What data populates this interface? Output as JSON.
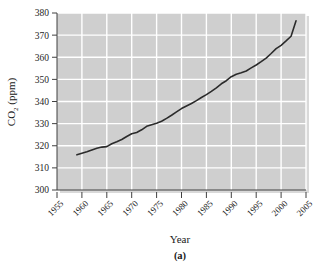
{
  "figure": {
    "panel_label": "(a)",
    "background_color": "#ffffff",
    "plot_background_color": "#cfcfcf",
    "grid_color": "#ffffff",
    "line_color": "#2b2b2b",
    "axis_color": "#404040",
    "shadow_color": "#d9d9d9"
  },
  "chart_data": {
    "type": "line",
    "title": "",
    "xlabel": "Year",
    "ylabel": "CO₂ (ppm)",
    "ylabel_main": "CO",
    "ylabel_sub": "2",
    "ylabel_unit": " (ppm)",
    "xlim": [
      1955,
      2005
    ],
    "ylim": [
      300,
      380
    ],
    "xticks": [
      1955,
      1960,
      1965,
      1970,
      1975,
      1980,
      1985,
      1990,
      1995,
      2000,
      2005
    ],
    "xtick_labels": [
      "1955",
      "1960",
      "1965",
      "1970",
      "1975",
      "1980",
      "1985",
      "1990",
      "1995",
      "2000",
      "2005"
    ],
    "yticks": [
      300,
      310,
      320,
      330,
      340,
      350,
      360,
      370,
      380
    ],
    "ytick_labels": [
      "300",
      "310",
      "320",
      "330",
      "340",
      "350",
      "360",
      "370",
      "380"
    ],
    "grid": true,
    "grid_axes": "both",
    "legend": false,
    "legend_position": "none",
    "xtick_label_rotation": -45,
    "series": [
      {
        "name": "Atmospheric CO2 concentration",
        "x": [
          1959,
          1960,
          1961,
          1962,
          1963,
          1964,
          1965,
          1966,
          1967,
          1968,
          1969,
          1970,
          1971,
          1972,
          1973,
          1974,
          1975,
          1976,
          1977,
          1978,
          1979,
          1980,
          1981,
          1982,
          1983,
          1984,
          1985,
          1986,
          1987,
          1988,
          1989,
          1990,
          1991,
          1992,
          1993,
          1994,
          1995,
          1996,
          1997,
          1998,
          1999,
          2000,
          2001,
          2002,
          2003
        ],
        "values": [
          315.9,
          316.6,
          317.3,
          318.1,
          318.9,
          319.4,
          319.6,
          320.9,
          321.8,
          322.8,
          324.2,
          325.4,
          326.0,
          327.2,
          328.8,
          329.5,
          330.2,
          331.1,
          332.4,
          333.8,
          335.3,
          336.8,
          338.0,
          339.1,
          340.4,
          341.8,
          343.1,
          344.6,
          346.2,
          348.0,
          349.4,
          351.2,
          352.3,
          353.0,
          353.8,
          355.2,
          356.5,
          358.0,
          359.6,
          361.7,
          363.9,
          365.4,
          367.4,
          369.5,
          376.5
        ]
      }
    ]
  }
}
